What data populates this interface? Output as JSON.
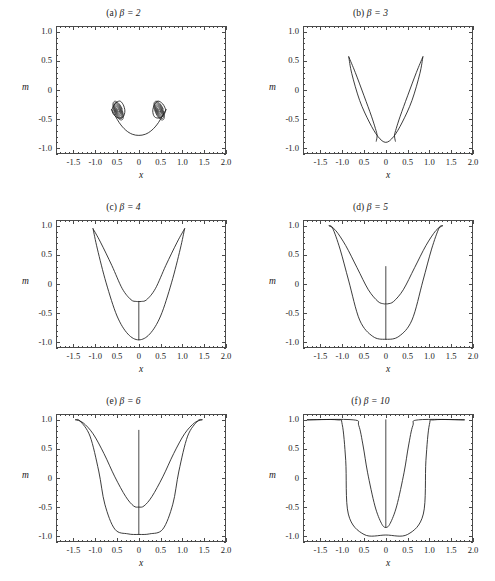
{
  "figure": {
    "axis_x_name": "x",
    "axis_y_name": "m",
    "x_ticks": [
      "-1.5",
      "-1.0",
      "0.5",
      "0",
      "0.5",
      "1.0",
      "1.5",
      "2.0"
    ],
    "x_tick_values": [
      -1.5,
      -1.0,
      -0.5,
      0,
      0.5,
      1.0,
      1.5,
      2.0
    ],
    "y_ticks": [
      "1.0",
      "0.5",
      "0",
      "-0.5",
      "-1.0"
    ],
    "y_tick_values": [
      1.0,
      0.5,
      0,
      -0.5,
      -1.0
    ],
    "line_color": "#1a1a1a",
    "frame_color": "#4a4a4a"
  },
  "panels": [
    {
      "id": "a",
      "label": "(a)",
      "beta_text": "β = 2",
      "title": "(a) β = 2",
      "beta": 2
    },
    {
      "id": "b",
      "label": "(b)",
      "beta_text": "β = 3",
      "title": "(b) β = 3",
      "beta": 3
    },
    {
      "id": "c",
      "label": "(c)",
      "beta_text": "β = 4",
      "title": "(c) β = 4",
      "beta": 4
    },
    {
      "id": "d",
      "label": "(d)",
      "beta_text": "β = 5",
      "title": "(d) β = 5",
      "beta": 5
    },
    {
      "id": "e",
      "label": "(e)",
      "beta_text": "β = 6",
      "title": "(e) β = 6",
      "beta": 6
    },
    {
      "id": "f",
      "label": "(f)",
      "beta_text": "β = 10",
      "title": "(f) β = 10",
      "beta": 10
    }
  ],
  "chart_data": [
    {
      "type": "line",
      "title": "(a) β = 2",
      "xlabel": "x",
      "ylabel": "m",
      "xlim": [
        -1.9,
        2.0
      ],
      "ylim": [
        -1.1,
        1.1
      ],
      "grid": false,
      "legend": null,
      "description": "Two dense nested spiral loops near (±0.45, -0.38) joined by a shallow arc dipping to m ≈ -0.78 at x = 0.",
      "series": [
        {
          "name": "arc",
          "x": [
            -0.62,
            -0.45,
            -0.3,
            -0.15,
            0.0,
            0.15,
            0.3,
            0.45,
            0.62
          ],
          "y": [
            -0.34,
            -0.56,
            -0.69,
            -0.76,
            -0.78,
            -0.76,
            -0.69,
            -0.56,
            -0.34
          ]
        },
        {
          "name": "left-spiral-outer",
          "x": [
            -0.62,
            -0.55,
            -0.44,
            -0.36,
            -0.32,
            -0.36,
            -0.47,
            -0.58,
            -0.62
          ],
          "y": [
            -0.34,
            -0.24,
            -0.19,
            -0.25,
            -0.36,
            -0.46,
            -0.48,
            -0.42,
            -0.34
          ]
        },
        {
          "name": "right-spiral-outer",
          "x": [
            0.62,
            0.55,
            0.44,
            0.36,
            0.32,
            0.36,
            0.47,
            0.58,
            0.62
          ],
          "y": [
            -0.34,
            -0.24,
            -0.19,
            -0.25,
            -0.36,
            -0.46,
            -0.48,
            -0.42,
            -0.34
          ]
        }
      ]
    },
    {
      "type": "line",
      "title": "(b) β = 3",
      "xlabel": "x",
      "ylabel": "m",
      "xlim": [
        -1.9,
        2.0
      ],
      "ylim": [
        -1.1,
        1.1
      ],
      "grid": false,
      "legend": null,
      "description": "Tulip / V shape: two petals peaking at m ≈ 0.57 near x = ±0.85, inner lobes meeting near x = ±0.2, base at m ≈ -0.90.",
      "series": [
        {
          "name": "outer-loop",
          "x": [
            -0.85,
            -0.78,
            -0.6,
            -0.38,
            -0.18,
            0.0,
            0.18,
            0.38,
            0.6,
            0.78,
            0.85
          ],
          "y": [
            0.57,
            0.28,
            -0.18,
            -0.55,
            -0.8,
            -0.9,
            -0.8,
            -0.55,
            -0.18,
            0.28,
            0.57
          ]
        },
        {
          "name": "inner-left",
          "x": [
            -0.85,
            -0.7,
            -0.5,
            -0.33,
            -0.24,
            -0.2,
            -0.22
          ],
          "y": [
            0.57,
            0.3,
            -0.1,
            -0.45,
            -0.66,
            -0.78,
            -0.88
          ]
        },
        {
          "name": "inner-right",
          "x": [
            0.85,
            0.7,
            0.5,
            0.33,
            0.24,
            0.2,
            0.22
          ],
          "y": [
            0.57,
            0.3,
            -0.1,
            -0.45,
            -0.66,
            -0.78,
            -0.88
          ]
        }
      ]
    },
    {
      "type": "line",
      "title": "(c) β = 4",
      "xlabel": "x",
      "ylabel": "m",
      "xlim": [
        -1.9,
        2.0
      ],
      "ylim": [
        -1.1,
        1.1
      ],
      "grid": false,
      "legend": null,
      "description": "Wide U well reaching m ≈ 0.95 at x ≈ ±1.05, floor m ≈ -0.96, with a thin vertical spike at x = 0 rising to m ≈ -0.27.",
      "series": [
        {
          "name": "outer",
          "x": [
            -1.05,
            -0.95,
            -0.75,
            -0.5,
            -0.25,
            0.0,
            0.25,
            0.5,
            0.75,
            0.95,
            1.05
          ],
          "y": [
            0.95,
            0.6,
            0.02,
            -0.55,
            -0.86,
            -0.96,
            -0.86,
            -0.55,
            0.02,
            0.6,
            0.95
          ]
        },
        {
          "name": "inner",
          "x": [
            -1.05,
            -0.88,
            -0.62,
            -0.38,
            -0.18,
            -0.06,
            0.0,
            0.06,
            0.18,
            0.38,
            0.62,
            0.88,
            1.05
          ],
          "y": [
            0.95,
            0.72,
            0.32,
            -0.08,
            -0.27,
            -0.3,
            -0.3,
            -0.3,
            -0.27,
            -0.08,
            0.32,
            0.72,
            0.95
          ]
        },
        {
          "name": "central-spike",
          "x": [
            0.0,
            0.0
          ],
          "y": [
            -0.3,
            -0.96
          ]
        }
      ]
    },
    {
      "type": "line",
      "title": "(d) β = 5",
      "xlabel": "x",
      "ylabel": "m",
      "xlim": [
        -1.9,
        2.0
      ],
      "ylim": [
        -1.1,
        1.1
      ],
      "grid": false,
      "legend": null,
      "description": "Flat-topped well saturating at m = 1.0 for |x| > 1.25, floor m ≈ -0.95, sharp central spike at x = 0 rising to m ≈ 0.30.",
      "series": [
        {
          "name": "outer",
          "x": [
            -1.3,
            -1.22,
            -1.05,
            -0.85,
            -0.6,
            -0.3,
            0.0,
            0.3,
            0.6,
            0.85,
            1.05,
            1.22,
            1.3
          ],
          "y": [
            1.0,
            0.96,
            0.6,
            0.05,
            -0.62,
            -0.9,
            -0.95,
            -0.9,
            -0.62,
            0.05,
            0.6,
            0.96,
            1.0
          ]
        },
        {
          "name": "inner",
          "x": [
            -1.3,
            -1.15,
            -0.92,
            -0.66,
            -0.4,
            -0.18,
            -0.05,
            0.0,
            0.05,
            0.18,
            0.4,
            0.66,
            0.92,
            1.15,
            1.3
          ],
          "y": [
            1.0,
            0.92,
            0.66,
            0.28,
            -0.1,
            -0.3,
            -0.34,
            -0.34,
            -0.34,
            -0.3,
            -0.1,
            0.28,
            0.66,
            0.92,
            1.0
          ]
        },
        {
          "name": "central-spike",
          "x": [
            0.0,
            0.0
          ],
          "y": [
            0.3,
            -0.95
          ]
        }
      ]
    },
    {
      "type": "line",
      "title": "(e) β = 6",
      "xlabel": "x",
      "ylabel": "m",
      "xlim": [
        -1.9,
        2.0
      ],
      "ylim": [
        -1.1,
        1.1
      ],
      "grid": false,
      "legend": null,
      "description": "Steeper well, saturation m = 1.0 beyond |x| ≈ 1.40, floor m ≈ -0.97, inner branch minimum m ≈ -0.50, vertical spike at x = 0 up to m ≈ 0.82.",
      "series": [
        {
          "name": "outer",
          "x": [
            -1.45,
            -1.35,
            -1.12,
            -0.92,
            -0.78,
            -0.55,
            -0.25,
            0.0,
            0.25,
            0.55,
            0.78,
            0.92,
            1.12,
            1.35,
            1.45
          ],
          "y": [
            1.0,
            0.98,
            0.72,
            0.12,
            -0.45,
            -0.88,
            -0.96,
            -0.97,
            -0.96,
            -0.88,
            -0.45,
            0.12,
            0.72,
            0.98,
            1.0
          ]
        },
        {
          "name": "inner",
          "x": [
            -1.45,
            -1.28,
            -1.05,
            -0.8,
            -0.55,
            -0.3,
            -0.12,
            0.0,
            0.12,
            0.3,
            0.55,
            0.8,
            1.05,
            1.28,
            1.45
          ],
          "y": [
            1.0,
            0.95,
            0.76,
            0.42,
            0.02,
            -0.32,
            -0.48,
            -0.5,
            -0.48,
            -0.32,
            0.02,
            0.42,
            0.76,
            0.95,
            1.0
          ]
        },
        {
          "name": "central-spike",
          "x": [
            0.0,
            0.0
          ],
          "y": [
            0.82,
            -0.97
          ]
        }
      ]
    },
    {
      "type": "line",
      "title": "(f) β = 10",
      "xlabel": "x",
      "ylabel": "m",
      "xlim": [
        -1.9,
        2.0
      ],
      "ylim": [
        -1.1,
        1.1
      ],
      "grid": false,
      "legend": null,
      "description": "Near square well: outer branch flat at m = 1.0 for |x| > 1.0 dropping steeply to floor m ≈ -0.98; inner branch turns down near |x| ≈ 0.55 to m ≈ -0.85; tall vertical spike along x = 0.",
      "series": [
        {
          "name": "outer",
          "x": [
            -1.8,
            -1.12,
            -1.0,
            -0.92,
            -0.86,
            -0.5,
            0.0,
            0.5,
            0.86,
            0.92,
            1.0,
            1.12,
            1.8
          ],
          "y": [
            1.0,
            1.0,
            0.92,
            0.3,
            -0.62,
            -0.97,
            -0.98,
            -0.97,
            -0.62,
            0.3,
            0.92,
            1.0,
            1.0
          ]
        },
        {
          "name": "inner",
          "x": [
            -1.8,
            -0.75,
            -0.62,
            -0.52,
            -0.42,
            -0.25,
            -0.1,
            0.0,
            0.1,
            0.25,
            0.42,
            0.52,
            0.62,
            0.75,
            1.8
          ],
          "y": [
            1.0,
            1.0,
            0.9,
            0.55,
            0.1,
            -0.48,
            -0.78,
            -0.85,
            -0.78,
            -0.48,
            0.1,
            0.55,
            0.9,
            1.0,
            1.0
          ]
        },
        {
          "name": "central-spike",
          "x": [
            0.0,
            0.0
          ],
          "y": [
            1.0,
            -0.85
          ]
        }
      ]
    }
  ]
}
